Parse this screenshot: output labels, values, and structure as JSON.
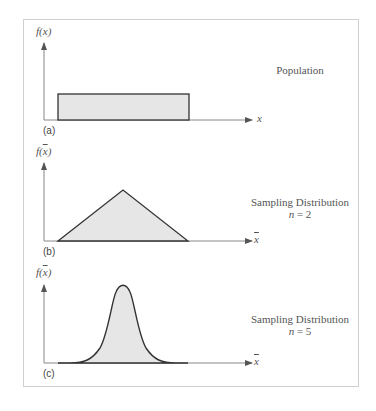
{
  "figure": {
    "panels": [
      {
        "tag": "(a)",
        "ylabel_fn": "f",
        "ylabel_var": "x",
        "ylabel_bar": false,
        "xlabel": "x",
        "xlabel_bar": false,
        "caption": "Population",
        "caption_n": "",
        "shape": "uniform"
      },
      {
        "tag": "(b)",
        "ylabel_fn": "f",
        "ylabel_var": "x",
        "ylabel_bar": true,
        "xlabel": "x",
        "xlabel_bar": true,
        "caption": "Sampling Distribution",
        "caption_n_var": "n",
        "caption_n_val": "= 2",
        "shape": "triangular"
      },
      {
        "tag": "(c)",
        "ylabel_fn": "f",
        "ylabel_var": "x",
        "ylabel_bar": true,
        "xlabel": "x",
        "xlabel_bar": true,
        "caption": "Sampling Distribution",
        "caption_n_var": "n",
        "caption_n_val": "= 5",
        "shape": "bell"
      }
    ],
    "colors": {
      "fill": "#e6e6e6",
      "stroke": "#333333",
      "axis": "#888888",
      "frame": "#cfcfcf"
    }
  }
}
